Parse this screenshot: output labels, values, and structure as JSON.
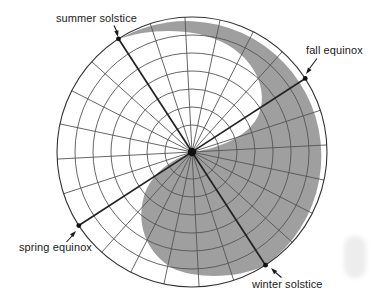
{
  "diagram": {
    "type": "polar seasonal daylight/darkness diagram",
    "colors": {
      "background": "#ffffff",
      "shade": "#9f9f9f",
      "grid_line": "#555555",
      "axis_line": "#222222",
      "outer_circle": "#333333",
      "marker": "#111111",
      "text": "#1a1a1a"
    },
    "grid": {
      "spokes": 24,
      "spoke_step_deg": 15,
      "rotation_deg": 3,
      "rings": 7,
      "season_axes_deg": [
        33,
        123,
        213,
        303
      ]
    },
    "labels": {
      "summer_solstice": "summer solstice",
      "fall_equinox": "fall equinox",
      "spring_equinox": "spring equinox",
      "winter_solstice": "winter solstice"
    }
  }
}
